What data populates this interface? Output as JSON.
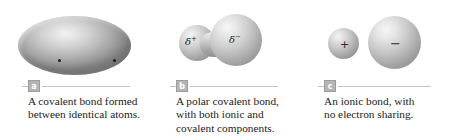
{
  "figure": {
    "background_color": "#ffffff",
    "text_color": "#1c1c1c",
    "rule_color": "#c3c3c3",
    "badge_color": "#b5b5b5"
  },
  "panels": [
    {
      "badge": "a",
      "artwork": "single-ellipse-with-two-electron-dots",
      "electron_dots": 2,
      "caption_lines": [
        "A covalent bond formed",
        "between identical atoms."
      ]
    },
    {
      "badge": "b",
      "artwork": "peanut-dumbbell-two-fused-lobes",
      "labels": {
        "left_symbol": "δ",
        "left_superscript": "+",
        "right_symbol": "δ",
        "right_superscript": "−"
      },
      "caption_lines": [
        "A polar covalent bond,",
        "with both ionic and",
        "covalent components."
      ]
    },
    {
      "badge": "c",
      "artwork": "two-separate-spheres",
      "labels": {
        "left_charge": "+",
        "right_charge": "−"
      },
      "caption_lines": [
        "An ionic bond, with",
        "no electron sharing."
      ]
    }
  ]
}
